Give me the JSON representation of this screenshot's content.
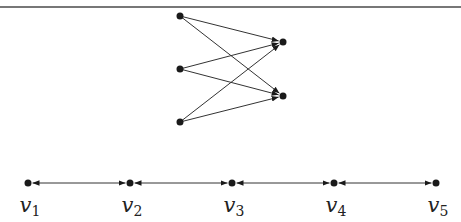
{
  "figure": {
    "top_rule": {
      "y": 7,
      "color": "#777777"
    },
    "bipartite": {
      "left_nodes": [
        {
          "id": "a1",
          "x": 180,
          "y": 16
        },
        {
          "id": "a2",
          "x": 180,
          "y": 69
        },
        {
          "id": "a3",
          "x": 180,
          "y": 122
        }
      ],
      "right_nodes": [
        {
          "id": "b1",
          "x": 283,
          "y": 42
        },
        {
          "id": "b2",
          "x": 283,
          "y": 96
        }
      ],
      "edges": [
        {
          "from": "a1",
          "to": "b1"
        },
        {
          "from": "a1",
          "to": "b2"
        },
        {
          "from": "a2",
          "to": "b1"
        },
        {
          "from": "a2",
          "to": "b2"
        },
        {
          "from": "a3",
          "to": "b1"
        },
        {
          "from": "a3",
          "to": "b2"
        }
      ]
    },
    "path": {
      "y": 183,
      "nodes": [
        {
          "id": "v1",
          "x": 28,
          "label": "v",
          "sub": "1"
        },
        {
          "id": "v2",
          "x": 130,
          "label": "v",
          "sub": "2"
        },
        {
          "id": "v3",
          "x": 232,
          "label": "v",
          "sub": "3"
        },
        {
          "id": "v4",
          "x": 334,
          "label": "v",
          "sub": "4"
        },
        {
          "id": "v5",
          "x": 436,
          "label": "v",
          "sub": "5"
        }
      ],
      "edges": [
        {
          "from": "v1",
          "to": "v2",
          "type": "bidirectional"
        },
        {
          "from": "v2",
          "to": "v3",
          "type": "bidirectional"
        },
        {
          "from": "v3",
          "to": "v4",
          "type": "bidirectional"
        },
        {
          "from": "v4",
          "to": "v5",
          "type": "bidirectional"
        }
      ]
    },
    "colors": {
      "node": "#1a1a1a",
      "edge": "#333333"
    }
  }
}
